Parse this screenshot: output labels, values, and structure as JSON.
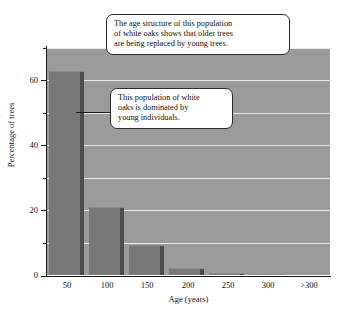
{
  "chart_data": {
    "type": "bar",
    "title": "",
    "subtitle": "",
    "xlabel": "Age (years)",
    "ylabel": "Percentage of trees",
    "categories": [
      "50",
      "100",
      "150",
      "200",
      "250",
      "300",
      ">300"
    ],
    "values": [
      63,
      21,
      9.2,
      2.1,
      0.7,
      0.3,
      0
    ],
    "ylim": [
      0,
      70
    ],
    "y_major_ticks": [
      0,
      20,
      40,
      60
    ],
    "y_minor_ticks": [
      10,
      30,
      50,
      70
    ],
    "y_tick_labels": [
      "0",
      "20",
      "40",
      "60"
    ],
    "grid": true,
    "grid_orientation": "horizontal",
    "legend": "none",
    "plot_background_color": "#9b9b9b",
    "bar_color": "#787878",
    "bar_shadow_color": "#4d4d4d",
    "gridline_color": "#e9e9e9",
    "axis_color": "#1a1a1a",
    "annotations": [
      {
        "id": "callout-top",
        "text": "The age structure of this population of white oaks shows that older trees are being replaced by young trees.",
        "lines": [
          "The age structure of this population",
          "of white oaks shows that older trees",
          "are being replaced by young trees."
        ]
      },
      {
        "id": "callout-bottom",
        "text": "This population of white oaks is dominated by young individuals.",
        "lines": [
          "This population of white",
          "oaks is dominated by",
          "young individuals."
        ],
        "points_to": "50"
      }
    ]
  },
  "axes": {
    "y_title": "Percentage of trees",
    "x_title": "Age (years)",
    "y_labels": [
      "60",
      "40",
      "20",
      "0"
    ],
    "x_labels": [
      "50",
      "100",
      "150",
      "200",
      "250",
      "300",
      ">300"
    ]
  }
}
